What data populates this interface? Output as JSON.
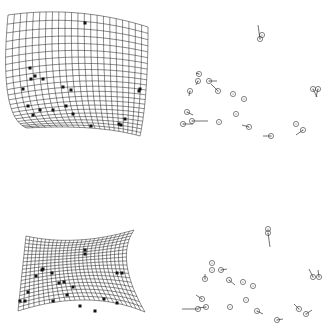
{
  "figure": {
    "panels": [
      {
        "id": "top-grid",
        "type": "deformation-grid",
        "corners": {
          "tl": [
            8,
            15
          ],
          "tm": [
            78,
            13
          ],
          "tr": [
            148,
            27
          ],
          "rm": [
            146,
            90
          ],
          "br": [
            140,
            136
          ],
          "bm": [
            90,
            128
          ],
          "bl": [
            27,
            128
          ],
          "lm": [
            8,
            95
          ]
        },
        "rows": 22,
        "cols": 22,
        "landmarks": [
          [
            85,
            23
          ],
          [
            30,
            68
          ],
          [
            31,
            79
          ],
          [
            35,
            76
          ],
          [
            43,
            79
          ],
          [
            23,
            89
          ],
          [
            63,
            87
          ],
          [
            71,
            90
          ],
          [
            28,
            106
          ],
          [
            40,
            110
          ],
          [
            53,
            110
          ],
          [
            66,
            106
          ],
          [
            33,
            115
          ],
          [
            73,
            114
          ],
          [
            140,
            89
          ],
          [
            139,
            91
          ],
          [
            91,
            126
          ],
          [
            125,
            119
          ],
          [
            119,
            124
          ],
          [
            121,
            125
          ]
        ]
      },
      {
        "id": "top-vectors",
        "type": "landmark-vectors",
        "points": [
          {
            "c": [
              260,
              39
            ],
            "v": [
              -2,
              -14
            ]
          },
          {
            "c": [
              262,
              35
            ],
            "v": [
              0,
              0
            ]
          },
          {
            "c": [
              199,
              74
            ],
            "v": [
              -3,
              -1
            ]
          },
          {
            "c": [
              198,
              81
            ],
            "v": [
              -2,
              4
            ]
          },
          {
            "c": [
              209,
              81
            ],
            "v": [
              8,
              0
            ]
          },
          {
            "c": [
              218,
              91
            ],
            "v": [
              -7,
              -7
            ]
          },
          {
            "c": [
              190,
              91
            ],
            "v": [
              -1,
              5
            ]
          },
          {
            "c": [
              233,
              94
            ],
            "v": [
              0,
              0
            ]
          },
          {
            "c": [
              244,
              99
            ],
            "v": [
              0,
              0
            ]
          },
          {
            "c": [
              187,
              112
            ],
            "v": [
              6,
              3
            ]
          },
          {
            "c": [
              236,
              114
            ],
            "v": [
              0,
              0
            ]
          },
          {
            "c": [
              183,
              124
            ],
            "v": [
              10,
              0
            ]
          },
          {
            "c": [
              192,
              121
            ],
            "v": [
              16,
              0
            ]
          },
          {
            "c": [
              219,
              122
            ],
            "v": [
              0,
              0
            ]
          },
          {
            "c": [
              249,
              127
            ],
            "v": [
              -7,
              -2
            ]
          },
          {
            "c": [
              271,
              136
            ],
            "v": [
              -8,
              0
            ]
          },
          {
            "c": [
              313,
              89
            ],
            "v": [
              4,
              8
            ]
          },
          {
            "c": [
              318,
              89
            ],
            "v": [
              -2,
              8
            ]
          },
          {
            "c": [
              296,
              124
            ],
            "v": [
              0,
              0
            ]
          },
          {
            "c": [
              303,
              130
            ],
            "v": [
              -7,
              5
            ]
          }
        ]
      },
      {
        "id": "bottom-grid",
        "type": "deformation-grid",
        "corners": {
          "tl": [
            26,
            236
          ],
          "tm": [
            78,
            240
          ],
          "tr": [
            134,
            230
          ],
          "rm": [
            127,
            265
          ],
          "br": [
            145,
            312
          ],
          "bm": [
            85,
            300
          ],
          "bl": [
            18,
            311
          ],
          "lm": [
            22,
            273
          ]
        },
        "rows": 20,
        "cols": 26,
        "landmarks": [
          [
            85,
            250
          ],
          [
            85,
            254
          ],
          [
            42,
            270
          ],
          [
            43,
            269
          ],
          [
            52,
            273
          ],
          [
            36,
            276
          ],
          [
            59,
            283
          ],
          [
            64,
            282
          ],
          [
            73,
            287
          ],
          [
            67,
            295
          ],
          [
            28,
            292
          ],
          [
            20,
            301
          ],
          [
            25,
            301
          ],
          [
            53,
            301
          ],
          [
            117,
            273
          ],
          [
            122,
            273
          ],
          [
            104,
            299
          ],
          [
            80,
            306
          ],
          [
            117,
            303
          ],
          [
            95,
            311
          ]
        ]
      },
      {
        "id": "bottom-vectors",
        "type": "landmark-vectors",
        "points": [
          {
            "c": [
              268,
              229
            ],
            "v": [
              0,
              0
            ]
          },
          {
            "c": [
              268,
              233
            ],
            "v": [
              2,
              14
            ]
          },
          {
            "c": [
              212,
              263
            ],
            "v": [
              0,
              0
            ]
          },
          {
            "c": [
              212,
              270
            ],
            "v": [
              0,
              0
            ]
          },
          {
            "c": [
              221,
              270
            ],
            "v": [
              6,
              -1
            ]
          },
          {
            "c": [
              205,
              279
            ],
            "v": [
              0,
              -5
            ]
          },
          {
            "c": [
              229,
              280
            ],
            "v": [
              6,
              5
            ]
          },
          {
            "c": [
              243,
              282
            ],
            "v": [
              0,
              0
            ]
          },
          {
            "c": [
              253,
              286
            ],
            "v": [
              0,
              0
            ]
          },
          {
            "c": [
              246,
              300
            ],
            "v": [
              0,
              0
            ]
          },
          {
            "c": [
              202,
              299
            ],
            "v": [
              -6,
              -4
            ]
          },
          {
            "c": [
              198,
              309
            ],
            "v": [
              -16,
              0
            ]
          },
          {
            "c": [
              206,
              307
            ],
            "v": [
              -8,
              1
            ]
          },
          {
            "c": [
              230,
              307
            ],
            "v": [
              0,
              0
            ]
          },
          {
            "c": [
              257,
              311
            ],
            "v": [
              6,
              3
            ]
          },
          {
            "c": [
              277,
              320
            ],
            "v": [
              6,
              -1
            ]
          },
          {
            "c": [
              313,
              277
            ],
            "v": [
              -4,
              -8
            ]
          },
          {
            "c": [
              319,
              277
            ],
            "v": [
              -1,
              -7
            ]
          },
          {
            "c": [
              299,
              309
            ],
            "v": [
              -5,
              -5
            ]
          },
          {
            "c": [
              306,
              314
            ],
            "v": [
              6,
              -4
            ]
          }
        ]
      }
    ]
  },
  "colors": {
    "grid": "#2a2a2a",
    "landmark": "#111111",
    "circle": "#333333",
    "background": "#ffffff"
  }
}
